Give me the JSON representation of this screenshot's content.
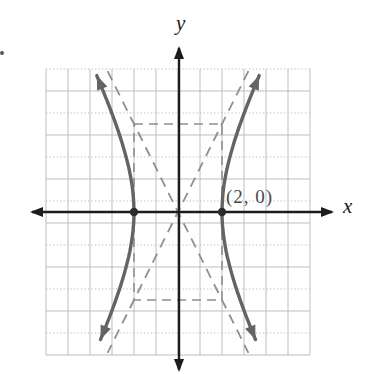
{
  "figure": {
    "labels": {
      "y_axis": "y",
      "x_axis": "x",
      "point": "(2, 0)"
    },
    "colors": {
      "background": "#ffffff",
      "grid": "#b9bdc3",
      "axis": "#1c1c1c",
      "curve": "#646464",
      "dashed": "#8e8e8e",
      "vertex_dot": "#2d2d2d",
      "axis_label": "#1c1c1c",
      "point_label": "#4a4a4a"
    }
  },
  "chart_data": {
    "type": "line",
    "xlabel": "x",
    "ylabel": "y",
    "xlim": [
      -6,
      6
    ],
    "ylim": [
      -6.5,
      6.5
    ],
    "grid": true,
    "grid_step": 1,
    "axis_tick_labels": false,
    "hyperbola": {
      "center": [
        0,
        0
      ],
      "orientation": "horizontal",
      "a": 2,
      "b": 4,
      "vertices": [
        [
          -2,
          0
        ],
        [
          2,
          0
        ]
      ]
    },
    "marked_points": [
      [
        -2,
        0
      ],
      [
        2,
        0
      ]
    ],
    "labeled_point": {
      "label": "(2, 0)",
      "x": 2,
      "y": 0
    },
    "asymptotes": [
      {
        "slope": 2,
        "intercept": 0,
        "style": "dashed"
      },
      {
        "slope": -2,
        "intercept": 0,
        "style": "dashed"
      }
    ],
    "central_rectangle": {
      "x": [
        -2,
        2
      ],
      "y": [
        -4,
        4
      ],
      "style": "dashed"
    },
    "curve_extent_units": {
      "y_top": 6.2,
      "y_bottom": -5.8
    },
    "legend": null
  }
}
